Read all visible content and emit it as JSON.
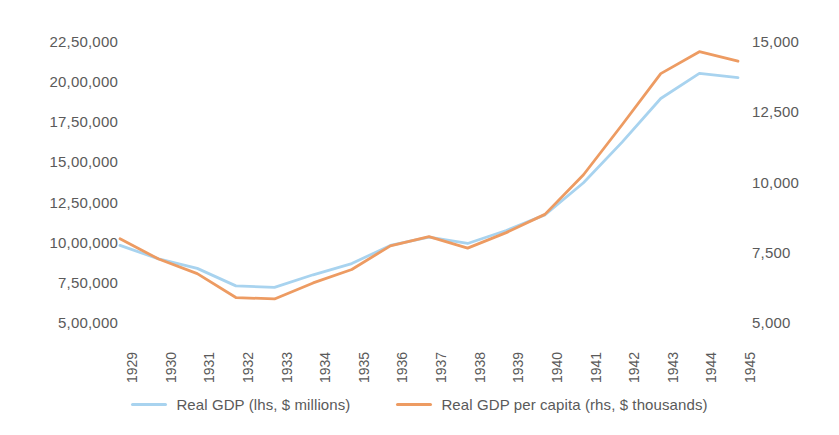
{
  "chart_data": {
    "type": "line",
    "title": "",
    "subtitle": "",
    "xlabel": "",
    "ylabel": "",
    "grid": false,
    "legend_position": "bottom",
    "categories": [
      "1929",
      "1930",
      "1931",
      "1932",
      "1933",
      "1934",
      "1935",
      "1936",
      "1937",
      "1938",
      "1939",
      "1940",
      "1941",
      "1942",
      "1943",
      "1944",
      "1945"
    ],
    "axes": {
      "left": {
        "label": "Real GDP (lhs, $ millions)",
        "ticks": [
          "5,00,000",
          "7,50,000",
          "10,00,000",
          "12,50,000",
          "15,00,000",
          "17,50,000",
          "20,00,000",
          "22,50,000"
        ],
        "tick_values": [
          500000,
          750000,
          1000000,
          1250000,
          1500000,
          1750000,
          2000000,
          2250000
        ],
        "ylim": [
          500000,
          2250000
        ],
        "format": "indian-grouping"
      },
      "right": {
        "label": "Real GDP per capita (rhs, $ thousands)",
        "ticks": [
          "5,000",
          "7,500",
          "10,000",
          "12,500",
          "15,000"
        ],
        "tick_values": [
          5000,
          7500,
          10000,
          12500,
          15000
        ],
        "ylim": [
          5000,
          15000
        ]
      }
    },
    "series": [
      {
        "name": "Real GDP (lhs, $ millions)",
        "axis": "left",
        "color": "#A8D3EF",
        "values": [
          977000,
          893000,
          834000,
          725000,
          716000,
          794000,
          864000,
          977000,
          1028000,
          989000,
          1070000,
          1167000,
          1367000,
          1620000,
          1892000,
          2048000,
          2022000
        ]
      },
      {
        "name": "Real GDP per capita (rhs, $ thousands)",
        "axis": "right",
        "color": "#ED9B62",
        "values": [
          7960,
          7240,
          6720,
          5870,
          5820,
          6390,
          6870,
          7710,
          8040,
          7630,
          8180,
          8830,
          10240,
          12020,
          13840,
          14620,
          14280
        ]
      }
    ]
  },
  "legend": {
    "items": [
      {
        "label": "Real GDP (lhs, $ millions)",
        "color": "#A8D3EF"
      },
      {
        "label": "Real GDP per capita (rhs, $ thousands)",
        "color": "#ED9B62"
      }
    ]
  },
  "colors": {
    "series_blue": "#A8D3EF",
    "series_orange": "#ED9B62",
    "text": "#5a5a5a",
    "background": "#ffffff"
  }
}
